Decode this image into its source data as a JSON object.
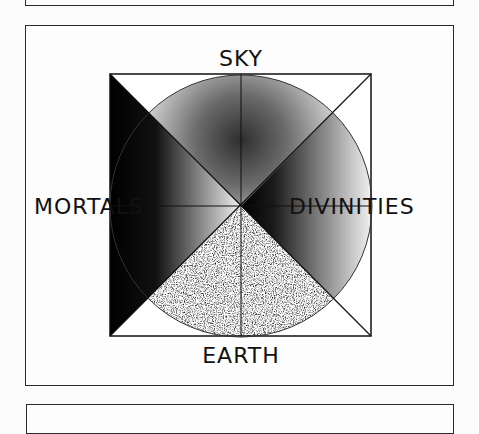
{
  "diagram": {
    "labels": {
      "top": "SKY",
      "bottom": "EARTH",
      "left": "MORTALS",
      "right": "DIVINITIES"
    },
    "colors": {
      "line": "#111111",
      "background": "#fdfdfd",
      "dark": "#000000",
      "light": "#ffffff"
    }
  }
}
